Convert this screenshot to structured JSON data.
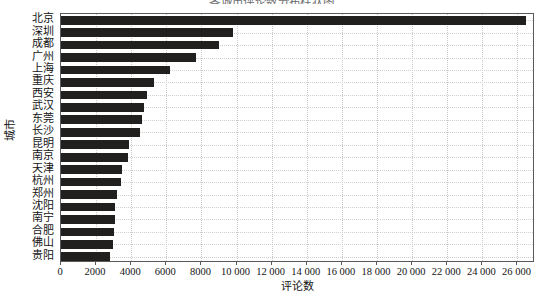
{
  "chart_data": {
    "type": "bar",
    "orientation": "horizontal",
    "title": "各城市评论数分布柱状图",
    "xlabel": "评论数",
    "ylabel": "城市",
    "xlim": [
      0,
      27000
    ],
    "ylim_categories": 21,
    "grid": true,
    "legend": null,
    "bar_color": "#221f1f",
    "xtick_labels": [
      "0",
      "2000",
      "4000",
      "6000",
      "8000",
      "10 000",
      "12 000",
      "14 000",
      "16 000",
      "18 000",
      "20 000",
      "22 000",
      "24 000",
      "26 000"
    ],
    "xtick_values": [
      0,
      2000,
      4000,
      6000,
      8000,
      10000,
      12000,
      14000,
      16000,
      18000,
      20000,
      22000,
      24000,
      26000
    ],
    "categories": [
      "北京",
      "深圳",
      "成都",
      "广州",
      "上海",
      "重庆",
      "西安",
      "武汉",
      "东莞",
      "长沙",
      "昆明",
      "南京",
      "天津",
      "杭州",
      "郑州",
      "沈阳",
      "南宁",
      "合肥",
      "佛山",
      "贵阳"
    ],
    "values": [
      26500,
      9800,
      9000,
      7700,
      6200,
      5300,
      4900,
      4700,
      4600,
      4500,
      3900,
      3800,
      3450,
      3400,
      3200,
      3100,
      3050,
      3000,
      2950,
      2800
    ]
  }
}
